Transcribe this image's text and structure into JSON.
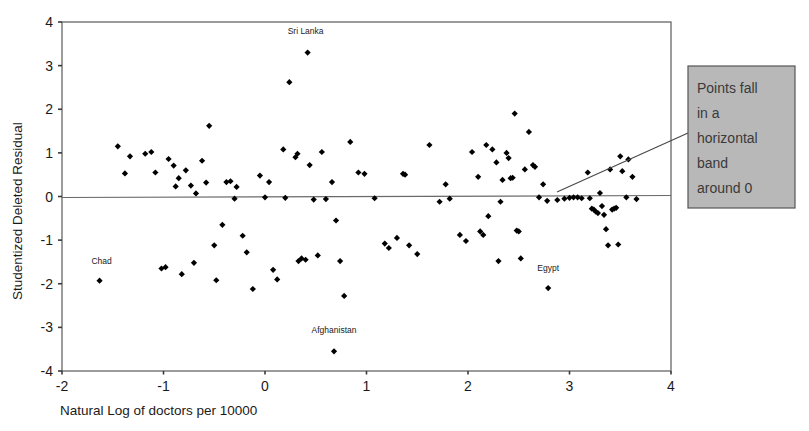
{
  "chart_data": {
    "type": "scatter",
    "title": "",
    "xlabel": "Natural Log of doctors per 10000",
    "ylabel": "Studentized Deleted Residual",
    "xlim": [
      -2,
      4
    ],
    "ylim": [
      -4,
      4
    ],
    "xticks": [
      "-2",
      "-1",
      "0",
      "1",
      "2",
      "3",
      "4"
    ],
    "xtick_values": [
      -2,
      -1,
      0,
      1,
      2,
      3,
      4
    ],
    "yticks": [
      "4",
      "3",
      "2",
      "1",
      "0",
      "-1",
      "-2",
      "-3",
      "-4"
    ],
    "ytick_values": [
      4,
      3,
      2,
      1,
      0,
      -1,
      -2,
      -3,
      -4
    ],
    "grid": false,
    "reference_line": {
      "orientation": "horizontal",
      "y": 0
    },
    "legend": null,
    "marker": {
      "shape": "diamond",
      "color": "#000000",
      "size": 4
    },
    "annotations": [
      {
        "name": "sri-lanka",
        "label": "Sri Lanka",
        "x": 0.42,
        "y": 3.3,
        "label_dx": -0.02,
        "label_dy": 0.42
      },
      {
        "name": "chad",
        "label": "Chad",
        "x": -1.63,
        "y": -1.93,
        "label_dx": 0.02,
        "label_dy": 0.38
      },
      {
        "name": "egypt",
        "label": "Egypt",
        "x": 2.79,
        "y": -2.1,
        "label_dx": 0.0,
        "label_dy": 0.4
      },
      {
        "name": "afghanistan",
        "label": "Afghanistan",
        "x": 0.68,
        "y": -3.55,
        "label_dx": 0.0,
        "label_dy": 0.42
      }
    ],
    "callout": {
      "text": "Points fall in a horizontal band around 0",
      "lines": [
        "Points fall",
        "in a",
        "horizontal",
        "band",
        "around 0"
      ],
      "box": {
        "x": 688,
        "y": 66,
        "width": 107,
        "height": 142
      },
      "fill": "#b8b8b8",
      "border": "#555555",
      "leader_from": {
        "x": 688,
        "y": 133
      },
      "leader_to": {
        "x": 557,
        "y": 192
      }
    },
    "points": [
      [
        -1.45,
        1.15
      ],
      [
        -1.38,
        0.53
      ],
      [
        -1.18,
        0.98
      ],
      [
        -1.12,
        1.02
      ],
      [
        -1.08,
        0.55
      ],
      [
        -1.02,
        -1.65
      ],
      [
        -0.98,
        -1.62
      ],
      [
        -0.95,
        0.86
      ],
      [
        -0.9,
        0.71
      ],
      [
        -0.88,
        0.23
      ],
      [
        -0.85,
        0.42
      ],
      [
        -0.82,
        -1.78
      ],
      [
        -0.78,
        0.6
      ],
      [
        -0.73,
        0.25
      ],
      [
        -0.7,
        -1.52
      ],
      [
        -0.68,
        0.07
      ],
      [
        -0.62,
        0.82
      ],
      [
        -0.58,
        0.32
      ],
      [
        -0.55,
        1.62
      ],
      [
        -0.5,
        -1.12
      ],
      [
        -0.48,
        -1.92
      ],
      [
        -0.42,
        -0.65
      ],
      [
        -0.38,
        0.33
      ],
      [
        -0.34,
        0.35
      ],
      [
        -0.3,
        -0.05
      ],
      [
        -0.28,
        0.22
      ],
      [
        -0.22,
        -0.9
      ],
      [
        -0.18,
        -1.28
      ],
      [
        -0.12,
        -2.12
      ],
      [
        -0.05,
        0.48
      ],
      [
        0.0,
        -0.02
      ],
      [
        0.04,
        0.33
      ],
      [
        0.08,
        -1.68
      ],
      [
        0.12,
        -1.9
      ],
      [
        0.18,
        1.08
      ],
      [
        0.2,
        -0.03
      ],
      [
        0.24,
        2.62
      ],
      [
        0.3,
        0.9
      ],
      [
        0.32,
        0.98
      ],
      [
        0.33,
        -1.48
      ],
      [
        0.36,
        -1.42
      ],
      [
        0.4,
        -1.45
      ],
      [
        0.44,
        0.72
      ],
      [
        0.48,
        -0.07
      ],
      [
        0.52,
        -1.35
      ],
      [
        0.56,
        1.02
      ],
      [
        0.6,
        -0.06
      ],
      [
        0.66,
        0.33
      ],
      [
        0.7,
        -0.55
      ],
      [
        0.74,
        -1.48
      ],
      [
        0.78,
        -2.28
      ],
      [
        0.84,
        1.25
      ],
      [
        0.92,
        0.55
      ],
      [
        0.98,
        0.52
      ],
      [
        1.08,
        -0.04
      ],
      [
        1.18,
        -1.08
      ],
      [
        1.22,
        -1.18
      ],
      [
        1.3,
        -0.95
      ],
      [
        1.36,
        0.52
      ],
      [
        1.38,
        0.5
      ],
      [
        1.42,
        -1.12
      ],
      [
        1.5,
        -1.32
      ],
      [
        1.62,
        1.18
      ],
      [
        1.72,
        -0.12
      ],
      [
        1.78,
        0.28
      ],
      [
        1.82,
        -0.05
      ],
      [
        1.92,
        -0.88
      ],
      [
        1.98,
        -1.02
      ],
      [
        2.04,
        1.02
      ],
      [
        2.1,
        0.45
      ],
      [
        2.12,
        -0.8
      ],
      [
        2.15,
        -0.88
      ],
      [
        2.18,
        1.18
      ],
      [
        2.2,
        -0.45
      ],
      [
        2.24,
        1.08
      ],
      [
        2.28,
        0.78
      ],
      [
        2.3,
        -1.48
      ],
      [
        2.32,
        -0.12
      ],
      [
        2.34,
        0.38
      ],
      [
        2.38,
        1.0
      ],
      [
        2.4,
        0.88
      ],
      [
        2.42,
        0.42
      ],
      [
        2.44,
        0.43
      ],
      [
        2.46,
        1.9
      ],
      [
        2.48,
        -0.78
      ],
      [
        2.5,
        -0.8
      ],
      [
        2.52,
        -1.42
      ],
      [
        2.56,
        0.62
      ],
      [
        2.6,
        1.48
      ],
      [
        2.64,
        0.72
      ],
      [
        2.66,
        0.68
      ],
      [
        2.7,
        -0.02
      ],
      [
        2.74,
        0.28
      ],
      [
        2.78,
        -0.1
      ],
      [
        2.88,
        -0.08
      ],
      [
        2.95,
        -0.05
      ],
      [
        3.0,
        -0.03
      ],
      [
        3.04,
        -0.02
      ],
      [
        3.08,
        -0.02
      ],
      [
        3.12,
        -0.04
      ],
      [
        3.18,
        0.55
      ],
      [
        3.2,
        -0.04
      ],
      [
        3.22,
        -0.28
      ],
      [
        3.24,
        -0.3
      ],
      [
        3.26,
        -0.35
      ],
      [
        3.28,
        -0.38
      ],
      [
        3.3,
        0.08
      ],
      [
        3.32,
        -0.22
      ],
      [
        3.34,
        -0.42
      ],
      [
        3.36,
        -0.75
      ],
      [
        3.38,
        -1.12
      ],
      [
        3.4,
        0.62
      ],
      [
        3.42,
        -0.3
      ],
      [
        3.44,
        -0.28
      ],
      [
        3.46,
        -0.26
      ],
      [
        3.48,
        -1.1
      ],
      [
        3.5,
        0.92
      ],
      [
        3.52,
        0.58
      ],
      [
        3.56,
        -0.02
      ],
      [
        3.58,
        0.85
      ],
      [
        3.62,
        0.45
      ],
      [
        3.66,
        -0.06
      ],
      [
        -1.33,
        0.92
      ]
    ]
  }
}
